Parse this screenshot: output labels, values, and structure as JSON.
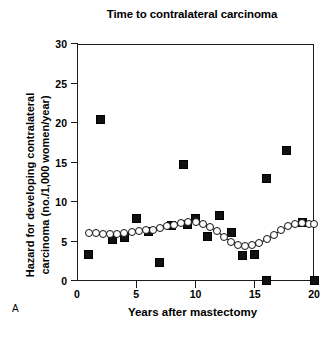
{
  "figure": {
    "panel_label": "A"
  },
  "chart_data": {
    "type": "scatter",
    "title": "Time to contralateral carcinoma",
    "xlabel": "Years after mastectomy",
    "ylabel": "Hazard for developing contralateral carcinoma (no./1,000 women/year)",
    "ylabel_lines": [
      "Hazard for developing contralateral",
      "carcinoma (no./1,000 women/year)"
    ],
    "xlim": [
      0,
      20
    ],
    "ylim": [
      0,
      30
    ],
    "xticks": [
      0,
      5,
      10,
      15,
      20
    ],
    "yticks": [
      0,
      5,
      10,
      15,
      20,
      25,
      30
    ],
    "xtick_labels": [
      "0",
      "5",
      "10",
      "15",
      "20"
    ],
    "ytick_labels": [
      "0",
      "5",
      "10",
      "15",
      "20",
      "25",
      "30"
    ],
    "grid": false,
    "legend": "none",
    "series": [
      {
        "name": "Observed annual hazard",
        "marker": "filled-square",
        "color": "#111111",
        "line": false,
        "points": [
          {
            "x": 1.0,
            "y": 3.4
          },
          {
            "x": 2.0,
            "y": 20.5
          },
          {
            "x": 3.0,
            "y": 5.3
          },
          {
            "x": 4.0,
            "y": 5.5
          },
          {
            "x": 5.0,
            "y": 7.9
          },
          {
            "x": 6.0,
            "y": 6.3
          },
          {
            "x": 7.0,
            "y": 2.3
          },
          {
            "x": 8.0,
            "y": 7.0
          },
          {
            "x": 9.0,
            "y": 14.8
          },
          {
            "x": 9.3,
            "y": 7.1
          },
          {
            "x": 10.0,
            "y": 7.9
          },
          {
            "x": 11.0,
            "y": 5.6
          },
          {
            "x": 12.0,
            "y": 8.3
          },
          {
            "x": 13.0,
            "y": 6.2
          },
          {
            "x": 14.0,
            "y": 3.2
          },
          {
            "x": 15.0,
            "y": 3.3
          },
          {
            "x": 16.0,
            "y": 0.1
          },
          {
            "x": 16.0,
            "y": 13.0
          },
          {
            "x": 17.7,
            "y": 16.5
          },
          {
            "x": 19.0,
            "y": 7.4
          },
          {
            "x": 20.0,
            "y": 0.1
          }
        ]
      },
      {
        "name": "Smoothed hazard curve",
        "marker": "open-circle",
        "color": "#111111",
        "line": true,
        "points": [
          {
            "x": 1.0,
            "y": 6.1
          },
          {
            "x": 1.6,
            "y": 6.1
          },
          {
            "x": 2.2,
            "y": 6.0
          },
          {
            "x": 2.8,
            "y": 6.0
          },
          {
            "x": 3.4,
            "y": 6.0
          },
          {
            "x": 4.0,
            "y": 6.1
          },
          {
            "x": 4.6,
            "y": 6.2
          },
          {
            "x": 5.2,
            "y": 6.3
          },
          {
            "x": 5.8,
            "y": 6.4
          },
          {
            "x": 6.4,
            "y": 6.5
          },
          {
            "x": 7.0,
            "y": 6.7
          },
          {
            "x": 7.6,
            "y": 6.9
          },
          {
            "x": 8.2,
            "y": 7.1
          },
          {
            "x": 8.8,
            "y": 7.3
          },
          {
            "x": 9.4,
            "y": 7.5
          },
          {
            "x": 10.0,
            "y": 7.5
          },
          {
            "x": 10.6,
            "y": 7.2
          },
          {
            "x": 11.2,
            "y": 6.8
          },
          {
            "x": 11.8,
            "y": 6.3
          },
          {
            "x": 12.4,
            "y": 5.6
          },
          {
            "x": 13.0,
            "y": 5.0
          },
          {
            "x": 13.6,
            "y": 4.6
          },
          {
            "x": 14.2,
            "y": 4.4
          },
          {
            "x": 14.8,
            "y": 4.5
          },
          {
            "x": 15.4,
            "y": 4.8
          },
          {
            "x": 16.0,
            "y": 5.3
          },
          {
            "x": 16.6,
            "y": 5.8
          },
          {
            "x": 17.2,
            "y": 6.4
          },
          {
            "x": 17.8,
            "y": 6.9
          },
          {
            "x": 18.4,
            "y": 7.2
          },
          {
            "x": 19.0,
            "y": 7.3
          },
          {
            "x": 19.6,
            "y": 7.2
          },
          {
            "x": 20.0,
            "y": 7.2
          }
        ]
      }
    ]
  }
}
